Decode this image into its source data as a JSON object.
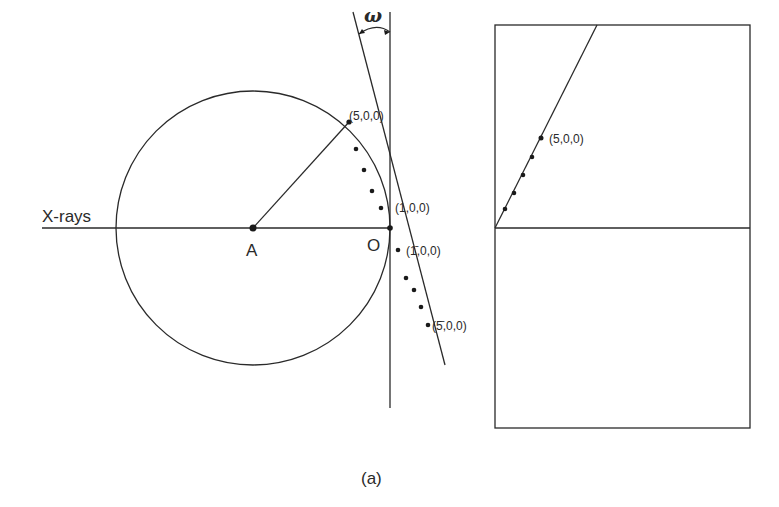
{
  "figure": {
    "caption": "(a)",
    "colors": {
      "ink": "#2a2a2a",
      "background": "#ffffff"
    }
  },
  "left_panel": {
    "xrays_label": "X-rays",
    "center_label": "A",
    "origin_label": "O",
    "angle_label": "ω",
    "points": [
      {
        "label": "(5,0,0)"
      },
      {
        "label": "(1,0,0)"
      },
      {
        "label": "(1̄,0,0)"
      },
      {
        "label": "(5̄,0,0)"
      }
    ]
  },
  "right_panel": {
    "points": [
      {
        "label": "(5,0,0)"
      }
    ]
  }
}
